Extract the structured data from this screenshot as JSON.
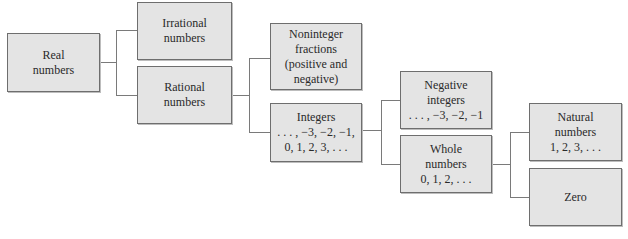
{
  "diagram": {
    "nodes": {
      "real": {
        "lines": [
          "Real",
          "numbers"
        ]
      },
      "irrational": {
        "lines": [
          "Irrational",
          "numbers"
        ]
      },
      "rational": {
        "lines": [
          "Rational",
          "numbers"
        ]
      },
      "noninteger": {
        "lines": [
          "Noninteger",
          "fractions",
          "(positive and",
          "negative)"
        ]
      },
      "integers": {
        "lines": [
          "Integers",
          ". . . , −3, −2, −1,",
          "0, 1, 2, 3, . . ."
        ]
      },
      "negative_integers": {
        "lines": [
          "Negative",
          "integers",
          ". . . , −3, −2, −1"
        ]
      },
      "whole": {
        "lines": [
          "Whole",
          "numbers",
          "0, 1, 2, . . ."
        ]
      },
      "natural": {
        "lines": [
          "Natural",
          "numbers",
          "1, 2, 3, . . ."
        ]
      },
      "zero": {
        "lines": [
          "Zero"
        ]
      }
    },
    "edges": [
      [
        "real",
        "irrational"
      ],
      [
        "real",
        "rational"
      ],
      [
        "rational",
        "noninteger"
      ],
      [
        "rational",
        "integers"
      ],
      [
        "integers",
        "negative_integers"
      ],
      [
        "integers",
        "whole"
      ],
      [
        "whole",
        "natural"
      ],
      [
        "whole",
        "zero"
      ]
    ],
    "colors": {
      "box_fill": "#e4e4e4",
      "box_border": "#6e6e6e",
      "connector": "#7a7a7a",
      "text": "#2a2a2a"
    }
  }
}
